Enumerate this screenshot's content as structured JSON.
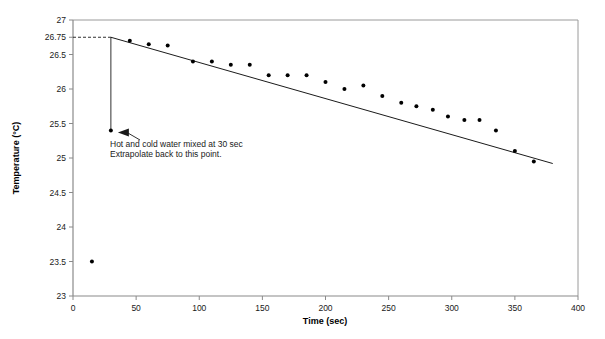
{
  "chart_data": {
    "type": "scatter",
    "title": "",
    "xlabel": "Time (sec)",
    "ylabel": "Temperature (°C)",
    "xlim": [
      0,
      400
    ],
    "ylim": [
      23,
      27
    ],
    "grid": false,
    "legend": "none",
    "x_ticks": [
      0,
      50,
      100,
      150,
      200,
      250,
      300,
      350,
      400
    ],
    "x_tick_labels": [
      "0",
      "50",
      "100",
      "150",
      "200",
      "250",
      "300",
      "350",
      "400"
    ],
    "y_ticks": [
      23,
      23.5,
      24,
      24.5,
      25,
      25.5,
      26,
      26.5,
      26.75,
      27
    ],
    "y_tick_labels": [
      "23",
      "23.5",
      "24",
      "24.5",
      "25",
      "25.5",
      "26",
      "26.5",
      "26.75",
      "27"
    ],
    "series": [
      {
        "name": "Mixture temperature",
        "type": "scatter",
        "marker": "filled-circle",
        "color": "#000000",
        "points": [
          {
            "x": 15,
            "y": 23.5
          },
          {
            "x": 30,
            "y": 25.4
          },
          {
            "x": 45,
            "y": 26.7
          },
          {
            "x": 60,
            "y": 26.65
          },
          {
            "x": 75,
            "y": 26.63
          },
          {
            "x": 95,
            "y": 26.4
          },
          {
            "x": 110,
            "y": 26.4
          },
          {
            "x": 125,
            "y": 26.35
          },
          {
            "x": 140,
            "y": 26.35
          },
          {
            "x": 155,
            "y": 26.2
          },
          {
            "x": 170,
            "y": 26.2
          },
          {
            "x": 185,
            "y": 26.2
          },
          {
            "x": 200,
            "y": 26.1
          },
          {
            "x": 215,
            "y": 26.0
          },
          {
            "x": 230,
            "y": 26.05
          },
          {
            "x": 245,
            "y": 25.9
          },
          {
            "x": 260,
            "y": 25.8
          },
          {
            "x": 272,
            "y": 25.75
          },
          {
            "x": 285,
            "y": 25.7
          },
          {
            "x": 297,
            "y": 25.6
          },
          {
            "x": 310,
            "y": 25.55
          },
          {
            "x": 322,
            "y": 25.55
          },
          {
            "x": 335,
            "y": 25.4
          },
          {
            "x": 350,
            "y": 25.1
          },
          {
            "x": 365,
            "y": 24.95
          }
        ]
      },
      {
        "name": "Linear extrapolation (trend line)",
        "type": "line",
        "color": "#000000",
        "x": [
          30,
          380
        ],
        "y": [
          26.75,
          24.92
        ]
      }
    ],
    "reference_lines": [
      {
        "name": "extrapolated-intercept-dashed",
        "orientation": "horizontal",
        "value": 26.75,
        "style": "dashed",
        "from_x": 0,
        "to_x": 30
      },
      {
        "name": "mixing-time-drop-line",
        "orientation": "vertical",
        "value": 30,
        "style": "solid",
        "from_y": 25.4,
        "to_y": 26.75
      }
    ],
    "annotations": [
      {
        "name": "mixing-annotation",
        "lines": [
          "Hot and cold water mixed at 30 sec",
          "Extrapolate back to this point."
        ],
        "target_x": 30,
        "target_y": 25.4,
        "arrow": true
      }
    ]
  }
}
